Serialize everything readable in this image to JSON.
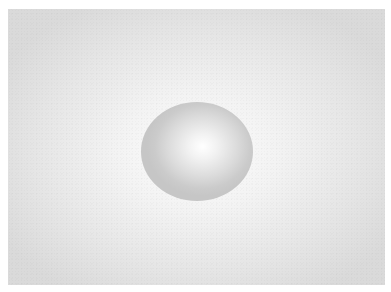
{
  "scene": {
    "description": "Shaded sphere on a softly lit gray backdrop",
    "colors": {
      "border": "#ffffff",
      "backdrop_center": "#fdfdfd",
      "backdrop_edge": "#dadada",
      "sphere_highlight": "#ffffff",
      "sphere_edge": "#c6c6c6"
    }
  }
}
